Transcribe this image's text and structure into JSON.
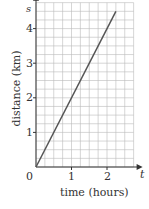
{
  "chart_data": {
    "type": "line",
    "title": "",
    "xlabel": "time (hours)",
    "ylabel": "distance (km)",
    "x_axis_symbol": "t",
    "y_axis_symbol": "s",
    "origin_label": "0",
    "x_ticks": [
      "1",
      "2"
    ],
    "y_ticks": [
      "1",
      "2",
      "3",
      "4"
    ],
    "xlim": [
      0,
      2.75
    ],
    "ylim": [
      0,
      4.75
    ],
    "grid": true,
    "grid_minor_step_x": 0.25,
    "grid_minor_step_y": 0.25,
    "series": [
      {
        "name": "distance",
        "x": [
          0,
          2.25
        ],
        "y": [
          0,
          4.5
        ],
        "color": "#555555"
      }
    ]
  }
}
